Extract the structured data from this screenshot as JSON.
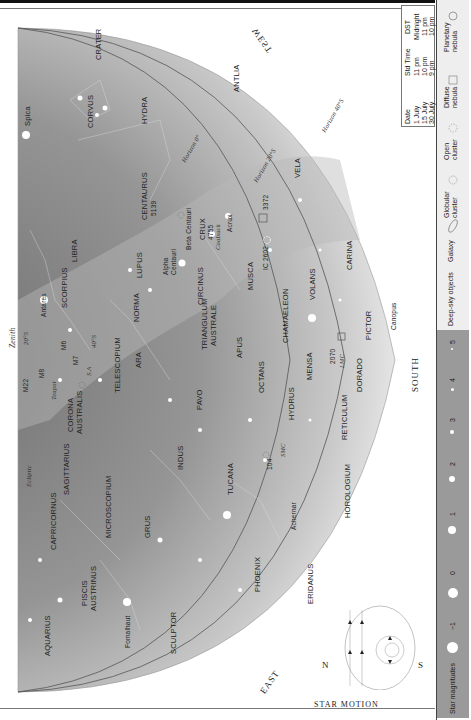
{
  "directions": {
    "east": "EAST",
    "west": "WEST",
    "south": "SOUTH",
    "zenith": "Zenith"
  },
  "horizons": [
    "Horizon 0°",
    "Horizon 20°S",
    "Horizon 40°S"
  ],
  "latitude_marks": [
    "20°S",
    "40°S"
  ],
  "ecliptic": "Ecliptic",
  "constellations": [
    "CRATER",
    "CORVUS",
    "HYDRA",
    "ANTLIA",
    "VELA",
    "CENTAURUS",
    "LIBRA",
    "LUPUS",
    "NORMA",
    "CIRCINUS",
    "CRUX",
    "MUSCA",
    "CARINA",
    "VOLANS",
    "CHAMAELEON",
    "SCORPIUS",
    "ARA",
    "TELESCOPIUM",
    "TRIANGULUM AUSTRALE",
    "APUS",
    "OCTANS",
    "MENSA",
    "PICTOR",
    "DORADO",
    "HYDRUS",
    "PAVO",
    "CORONA AUSTRALIS",
    "SAGITTARIUS",
    "INDUS",
    "TUCANA",
    "RETICULUM",
    "HOROLOGIUM",
    "CAPRICORNUS",
    "MICROSCOPIUM",
    "GRUS",
    "PHOENIX",
    "ERIDANUS",
    "PISCIS AUSTRINUS",
    "AQUARIUS",
    "SCULPTOR"
  ],
  "stars": [
    "Spica",
    "Antares",
    "Alpha Centauri",
    "Beta Centauri",
    "Acrux",
    "Canopus",
    "Achernar",
    "Fomalhaut"
  ],
  "deep_sky": [
    "5139",
    "4755",
    "3372",
    "IC 2602",
    "M6",
    "M7",
    "M8",
    "M22",
    "2070",
    "104",
    "LMC",
    "SMC",
    "Coalsack",
    "Teapot"
  ],
  "labels": {
    "crater": "CRATER",
    "corvus": "CORVUS",
    "hydra": "HYDRA",
    "antlia": "ANTLIA",
    "vela": "VELA",
    "centaurus": "CENTAURUS",
    "libra": "LIBRA",
    "lupus": "LUPUS",
    "norma": "NORMA",
    "circinus": "CIRCINUS",
    "crux": "CRUX",
    "musca": "MUSCA",
    "carina": "CARINA",
    "volans": "VOLANS",
    "chamaeleon": "CHAMAELEON",
    "scorpius": "SCORPIUS",
    "ara": "ARA",
    "telescopium": "TELESCOPIUM",
    "triangulum1": "TRIANGULUM",
    "triangulum2": "AUSTRALE",
    "apus": "APUS",
    "octans": "OCTANS",
    "mensa": "MENSA",
    "pictor": "PICTOR",
    "dorado": "DORADO",
    "hydrus": "HYDRUS",
    "pavo": "PAVO",
    "corona1": "CORONA",
    "corona2": "AUSTRALIS",
    "sagittarius": "SAGITTARIUS",
    "indus": "INDUS",
    "tucana": "TUCANA",
    "reticulum": "RETICULUM",
    "horologium": "HOROLOGIUM",
    "capricornus": "CAPRICORNUS",
    "microscopium": "MICROSCOPIUM",
    "grus": "GRUS",
    "phoenix": "PHOENIX",
    "eridanus": "ERIDANUS",
    "piscis1": "PISCIS",
    "piscis2": "AUSTRINUS",
    "aquarius": "AQUARIUS",
    "sculptor": "SCULPTOR",
    "spica": "Spica",
    "antares": "Antares",
    "alpha1": "Alpha",
    "alpha2": "Centauri",
    "beta": "Beta Centauri",
    "acrux": "Acrux",
    "canopus": "Canopus",
    "achernar": "Achernar",
    "fomalhaut": "Fomalhaut",
    "n5139": "5139",
    "n4755": "4755",
    "n3372": "3372",
    "ic2602": "IC 2602",
    "m6": "M6",
    "m7": "M7",
    "m8": "M8",
    "m22": "M22",
    "n2070": "2070",
    "n104": "104",
    "lmc": "LMC",
    "smc": "SMC",
    "coalsack": "Coalsack",
    "teapot": "Teapot",
    "east": "EAST",
    "west": "WEST",
    "south": "SOUTH",
    "zenith": "Zenith",
    "ecliptic": "Ecliptic",
    "h0": "Horizon 0°",
    "h20": "Horizon 20°S",
    "h40": "Horizon 40°S",
    "lat20": "20°S",
    "lat40": "40°S"
  },
  "time_table": {
    "headers": [
      "Date",
      "Std Time",
      "DST"
    ],
    "rows": [
      [
        "1 July",
        "11 pm",
        "Midnight"
      ],
      [
        "15 July",
        "10 pm",
        "11 pm"
      ],
      [
        "30 July",
        "9 pm",
        "10 pm"
      ]
    ]
  },
  "star_motion": {
    "title": "STAR MOTION",
    "north": "N",
    "south": "S"
  },
  "legend": {
    "deep_sky_title": "Deep-sky objects",
    "deep_sky_items": [
      "Galaxy",
      "Globular cluster",
      "Open cluster",
      "Diffuse nebula",
      "Planetary nebula"
    ],
    "magnitudes_title": "Star magnitudes",
    "magnitudes": [
      "−1",
      "0",
      "1",
      "2",
      "3",
      "4",
      "5"
    ]
  },
  "colors": {
    "sky_dark": "#7f7f7f",
    "sky_mid": "#9c9c9c",
    "sky_light": "#c8c8c8",
    "milky_way": "#b5b5b5",
    "legend_bg": "#9a9a9a"
  }
}
